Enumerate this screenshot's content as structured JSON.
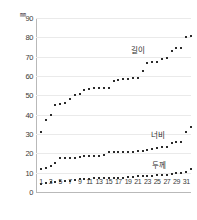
{
  "chart_data": {
    "type": "scatter",
    "title": "",
    "subtitle": "",
    "xlabel": "",
    "ylabel": "",
    "unit_label": "㎜",
    "xlim": [
      0,
      32
    ],
    "ylim": [
      0,
      90
    ],
    "grid": true,
    "legend_position": "inline-right",
    "y_ticks": [
      0,
      10,
      20,
      30,
      40,
      50,
      60,
      70,
      80,
      90
    ],
    "x_ticks": [
      1,
      3,
      5,
      7,
      9,
      11,
      13,
      15,
      17,
      19,
      21,
      23,
      25,
      27,
      29,
      31
    ],
    "x": [
      1,
      2,
      3,
      4,
      5,
      6,
      7,
      8,
      9,
      10,
      11,
      12,
      13,
      14,
      15,
      16,
      17,
      18,
      19,
      20,
      21,
      22,
      23,
      24,
      25,
      26,
      27,
      28,
      29,
      30,
      31,
      32
    ],
    "series": [
      {
        "name": "길이",
        "label": "길이",
        "color": "#2b2b2b",
        "values": [
          31,
          37,
          40,
          45,
          45.5,
          46,
          48,
          50,
          50.5,
          53,
          53.5,
          54,
          54,
          54,
          54,
          57.5,
          58,
          58.5,
          58.5,
          59,
          59,
          62.5,
          66.5,
          67,
          67.5,
          69,
          69.5,
          73,
          74.5,
          74.5,
          80,
          80.5
        ]
      },
      {
        "name": "너비",
        "label": "너비",
        "color": "#2b2b2b",
        "values": [
          12,
          12.5,
          13.5,
          15,
          17.5,
          17.5,
          17.5,
          17.5,
          18,
          18.5,
          18.5,
          18.5,
          18.5,
          19,
          20.5,
          20.5,
          20.5,
          20.5,
          20.5,
          20.5,
          21,
          21,
          21.5,
          22.5,
          23,
          23.5,
          23.5,
          25.5,
          26,
          26,
          31,
          33.5
        ]
      },
      {
        "name": "두께",
        "label": "두께",
        "color": "#2b2b2b",
        "values": [
          4,
          4.5,
          5,
          5,
          5.5,
          5.5,
          5.5,
          6,
          6.5,
          6.5,
          6.5,
          7,
          7,
          7,
          7,
          7.5,
          7.5,
          7.5,
          8,
          8,
          8.5,
          8.5,
          8.5,
          8.5,
          9,
          9,
          9,
          9.5,
          10,
          10,
          10.5,
          12
        ]
      }
    ],
    "series_label_positions": [
      {
        "name": "길이",
        "x_px": 131,
        "y_px": 44
      },
      {
        "name": "너비",
        "x_px": 151,
        "y_px": 129
      },
      {
        "name": "두께",
        "x_px": 152,
        "y_px": 159
      }
    ]
  }
}
